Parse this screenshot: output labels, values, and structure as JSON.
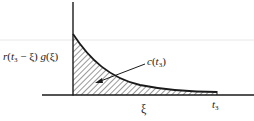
{
  "figure": {
    "type": "diagram",
    "y_axis_label_parts": {
      "r": "r",
      "open": "(",
      "t": "t",
      "t_sub": "3",
      "minus_xi": " − ξ) ",
      "g": "g",
      "g_arg": "(ξ)"
    },
    "curve_label_parts": {
      "c": "c",
      "open": "(",
      "t": "t",
      "t_sub": "3",
      "close": ")"
    },
    "x_axis_label": "ξ",
    "endpoint_label_parts": {
      "t": "t",
      "t_sub": "3"
    },
    "colors": {
      "ink": "#1a1a1a",
      "hatch": "#333333",
      "guide": "#e6e6e6",
      "background": "#ffffff"
    }
  }
}
